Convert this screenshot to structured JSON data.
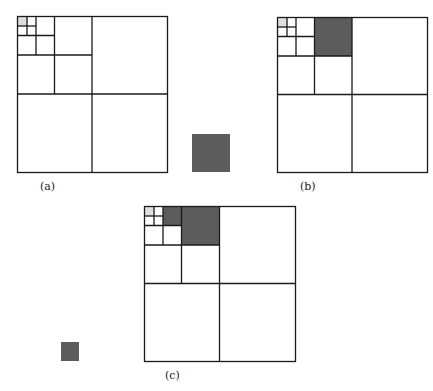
{
  "figure": {
    "colors": {
      "line": "#1a1a1a",
      "light_cell": "#dedede",
      "dark_cell": "#5c5c5c",
      "background": "#ffffff"
    },
    "panels": [
      {
        "id": "a",
        "caption": "(a)",
        "description": "Quadtree subdivision; smallest top-left cell shaded light gray",
        "shaded": [
          {
            "level": 3,
            "cell": "top-left",
            "shade": "light"
          }
        ]
      },
      {
        "id": "b",
        "caption": "(b)",
        "description": "Same subdivision; level-2 top-right sibling cell filled dark",
        "shaded": [
          {
            "level": 3,
            "cell": "top-left",
            "shade": "light"
          },
          {
            "level": 1,
            "cell": "top-right of top-left quadrant",
            "shade": "dark"
          }
        ]
      },
      {
        "id": "c",
        "caption": "(c)",
        "description": "Additional level-2 cell filled dark next to level-1 filled cell",
        "shaded": [
          {
            "level": 3,
            "cell": "top-left",
            "shade": "light"
          },
          {
            "level": 2,
            "cell": "top-right of smallest group",
            "shade": "dark"
          },
          {
            "level": 1,
            "cell": "top-right of top-left quadrant",
            "shade": "dark"
          }
        ]
      }
    ],
    "free_squares": [
      {
        "id": "large-block",
        "description": "Large dark block between panels a and b"
      },
      {
        "id": "small-block",
        "description": "Small dark block left of panel c"
      }
    ]
  }
}
